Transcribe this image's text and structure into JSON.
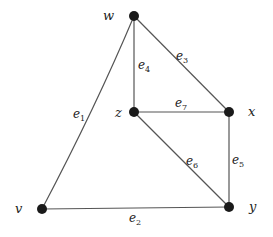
{
  "diagram": {
    "type": "graph",
    "nodes": [
      {
        "id": "w",
        "label": "w",
        "x": 134,
        "y": 16,
        "lx": 103,
        "ly": 20
      },
      {
        "id": "z",
        "label": "z",
        "x": 134,
        "y": 112,
        "lx": 115,
        "ly": 117
      },
      {
        "id": "x",
        "label": "x",
        "x": 229,
        "y": 112,
        "lx": 248,
        "ly": 116
      },
      {
        "id": "v",
        "label": "v",
        "x": 42,
        "y": 209,
        "lx": 15,
        "ly": 213
      },
      {
        "id": "y",
        "label": "y",
        "x": 229,
        "y": 207,
        "lx": 249,
        "ly": 211
      }
    ],
    "edges": [
      {
        "id": "e1",
        "base": "e",
        "sub": "1",
        "from": "v",
        "to": "w",
        "curve": true,
        "lx": 73,
        "ly": 118
      },
      {
        "id": "e2",
        "base": "e",
        "sub": "2",
        "from": "v",
        "to": "y",
        "curve": false,
        "lx": 129,
        "ly": 222
      },
      {
        "id": "e3",
        "base": "e",
        "sub": "3",
        "from": "w",
        "to": "x",
        "curve": false,
        "lx": 176,
        "ly": 60
      },
      {
        "id": "e4",
        "base": "e",
        "sub": "4",
        "from": "w",
        "to": "z",
        "curve": false,
        "lx": 138,
        "ly": 69
      },
      {
        "id": "e5",
        "base": "e",
        "sub": "5",
        "from": "x",
        "to": "y",
        "curve": false,
        "lx": 232,
        "ly": 164
      },
      {
        "id": "e6",
        "base": "e",
        "sub": "6",
        "from": "z",
        "to": "y",
        "curve": false,
        "lx": 186,
        "ly": 165
      },
      {
        "id": "e7",
        "base": "e",
        "sub": "7",
        "from": "z",
        "to": "x",
        "curve": false,
        "lx": 175,
        "ly": 107
      }
    ]
  },
  "colors": {
    "edge": "#555555",
    "node": "#1a1a1a",
    "label": "#222222",
    "background": "#ffffff"
  }
}
